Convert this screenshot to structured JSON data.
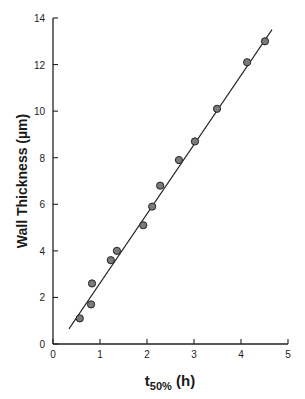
{
  "chart_data": {
    "type": "scatter",
    "title": "",
    "xlabel": "t50% (h)",
    "xlabel_main": "t",
    "xlabel_sub": "50%",
    "xlabel_unit": " (h)",
    "ylabel": "Wall Thickness (µm)",
    "xlim": [
      0,
      5
    ],
    "ylim": [
      0,
      14
    ],
    "xticks": [
      0,
      1,
      2,
      3,
      4,
      5
    ],
    "yticks": [
      0,
      2,
      4,
      6,
      8,
      10,
      12,
      14
    ],
    "grid": false,
    "legend": null,
    "series": [
      {
        "name": "measured",
        "marker": "filled-circle",
        "color": "#7a7a7a",
        "points": [
          {
            "x": 0.57,
            "y": 1.1
          },
          {
            "x": 0.81,
            "y": 1.7
          },
          {
            "x": 0.83,
            "y": 2.6
          },
          {
            "x": 1.23,
            "y": 3.6
          },
          {
            "x": 1.36,
            "y": 4.0
          },
          {
            "x": 1.92,
            "y": 5.1
          },
          {
            "x": 2.11,
            "y": 5.9
          },
          {
            "x": 2.28,
            "y": 6.8
          },
          {
            "x": 2.68,
            "y": 7.9
          },
          {
            "x": 3.02,
            "y": 8.7
          },
          {
            "x": 3.49,
            "y": 10.1
          },
          {
            "x": 4.13,
            "y": 12.1
          },
          {
            "x": 4.51,
            "y": 13.0
          }
        ]
      },
      {
        "name": "linear fit",
        "type": "line",
        "color": "#222222",
        "points": [
          {
            "x": 0.34,
            "y": 0.65
          },
          {
            "x": 4.66,
            "y": 13.5
          }
        ]
      }
    ]
  }
}
